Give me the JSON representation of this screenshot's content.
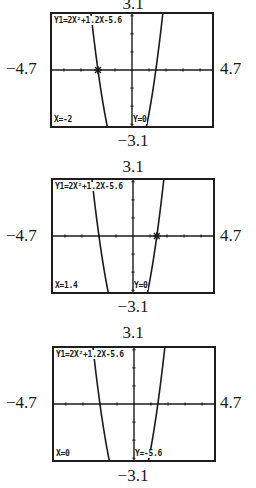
{
  "chart_data": {
    "type": "line",
    "title": "Y1=2X²+1.2X-5.6",
    "function": "y = 2x^2 + 1.2x - 5.6",
    "coefficients": {
      "a": 2,
      "b": 1.2,
      "c": -5.6
    },
    "window": {
      "xmin": -4.7,
      "xmax": 4.7,
      "ymin": -3.1,
      "ymax": 3.1
    },
    "xlim": [
      -4.7,
      4.7
    ],
    "ylim": [
      -3.1,
      3.1
    ],
    "xlabel": "",
    "ylabel": "",
    "grid": false,
    "axis_ticks": {
      "x_step": 1,
      "y_step": 1
    },
    "roots": [
      -2,
      1.4
    ],
    "y_intercept": -5.6,
    "trace_points": [
      {
        "x": -2,
        "y": 0,
        "x_label": "X=-2",
        "y_label": "Y=0"
      },
      {
        "x": 1.4,
        "y": 0,
        "x_label": "X=1.4",
        "y_label": "Y=0"
      },
      {
        "x": 0,
        "y": -5.6,
        "x_label": "X=0",
        "y_label": "Y=-5.6"
      }
    ]
  },
  "panels": [
    {
      "equation": "Y1=2X²+1.2X-5.6",
      "x_readout": "X=-2",
      "y_readout": "Y=0",
      "cursor": {
        "x": -2,
        "y": 0,
        "visible": true
      },
      "labels": {
        "top": "3.1",
        "bottom": "−3.1",
        "left": "−4.7",
        "right": "4.7"
      }
    },
    {
      "equation": "Y1=2X²+1.2X-5.6",
      "x_readout": "X=1.4",
      "y_readout": "Y=0",
      "cursor": {
        "x": 1.4,
        "y": 0,
        "visible": true
      },
      "labels": {
        "top": "3.1",
        "bottom": "−3.1",
        "left": "−4.7",
        "right": "4.7"
      }
    },
    {
      "equation": "Y1=2X²+1.2X-5.6",
      "x_readout": "X=0",
      "y_readout": "Y=-5.6",
      "cursor": {
        "x": 0,
        "y": -5.6,
        "visible": false
      },
      "labels": {
        "top": "3.1",
        "bottom": "−3.1",
        "left": "−4.7",
        "right": "4.7"
      }
    }
  ],
  "colors": {
    "ink": "#1a1a1a",
    "frame": "#1e1e1e",
    "background": "#ffffff"
  }
}
